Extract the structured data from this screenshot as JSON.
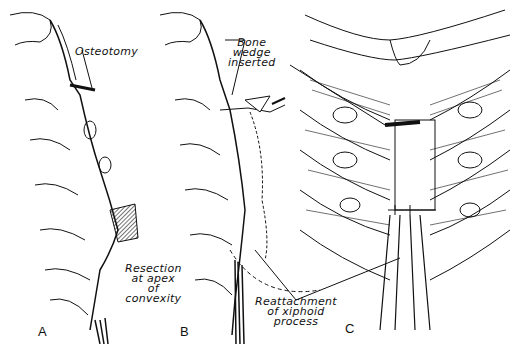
{
  "figure": {
    "panels": [
      {
        "id": "A",
        "label": "A",
        "annotations": [
          "Osteotomy"
        ]
      },
      {
        "id": "B",
        "label": "B",
        "annotations": [
          "Bone wedge inserted",
          "Resection at apex of convexity",
          "Reattachment of xiphoid process"
        ]
      },
      {
        "id": "C",
        "label": "C",
        "annotations": []
      }
    ],
    "labels": {
      "osteotomy": "Osteotomy",
      "bone_wedge_1": "Bone",
      "bone_wedge_2": "wedge",
      "bone_wedge_3": "inserted",
      "resection_1": "Resection",
      "resection_2": "at apex",
      "resection_3": "of",
      "resection_4": "convexity",
      "reattach_1": "Reattachment",
      "reattach_2": "of xiphoid",
      "reattach_3": "process",
      "panel_a": "A",
      "panel_b": "B",
      "panel_c": "C"
    },
    "colors": {
      "ink": "#111111",
      "background": "#ffffff"
    }
  }
}
